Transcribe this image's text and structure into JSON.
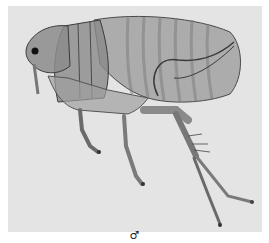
{
  "figure": {
    "caption_symbol": "♂",
    "background_color": "#e4e4e4",
    "specimen_color": "#6a6a6a"
  }
}
